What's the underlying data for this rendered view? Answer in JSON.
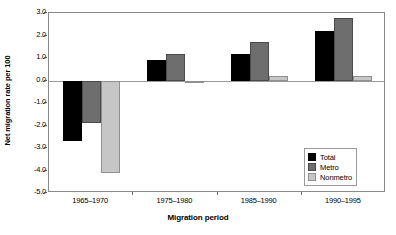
{
  "chart_data": {
    "type": "bar",
    "title": "",
    "xlabel": "Migration period",
    "ylabel": "Net migration rate per 100",
    "categories": [
      "1965–1970",
      "1975–1980",
      "1985–1990",
      "1990–1995"
    ],
    "series": [
      {
        "name": "Total",
        "color": "#000000",
        "values": [
          -2.7,
          0.9,
          1.2,
          2.2
        ]
      },
      {
        "name": "Metro",
        "color": "#6e6e6e",
        "values": [
          -1.9,
          1.2,
          1.7,
          2.8
        ]
      },
      {
        "name": "Nonmetro",
        "color": "#c6c6c6",
        "values": [
          -4.1,
          -0.1,
          0.2,
          0.2
        ]
      }
    ],
    "ylim": [
      -5.0,
      3.0
    ],
    "ytick_step": 1.0,
    "ytick_labels": [
      "3.0",
      "2.0",
      "1.0",
      "0.0",
      "-1.0",
      "-2.0",
      "-3.0",
      "-4.0",
      "-5.0"
    ],
    "ytick_values": [
      3.0,
      2.0,
      1.0,
      0.0,
      -1.0,
      -2.0,
      -3.0,
      -4.0,
      -5.0
    ],
    "grid": false,
    "zero_line": true,
    "legend_position": "lower-right",
    "legend_entries": [
      "Total",
      "Metro",
      "Nonmetro"
    ]
  }
}
